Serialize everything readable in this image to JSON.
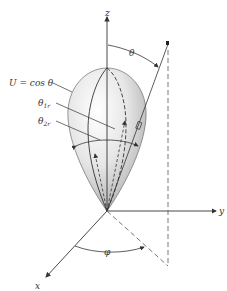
{
  "figure": {
    "axes": {
      "z_label": "z",
      "y_label": "y",
      "x_label": "x"
    },
    "angles": {
      "theta": "θ",
      "phi": "φ"
    },
    "annotations": {
      "pattern_label": "U = cos θ",
      "theta1r_main": "θ",
      "theta1r_sub": "1r",
      "theta2r_main": "θ",
      "theta2r_sub": "2r",
      "solid_angle": "dΩ"
    },
    "colors": {
      "line": "#333333",
      "lobe_light": "#ffffff",
      "lobe_dark": "#9a9a9a"
    }
  }
}
